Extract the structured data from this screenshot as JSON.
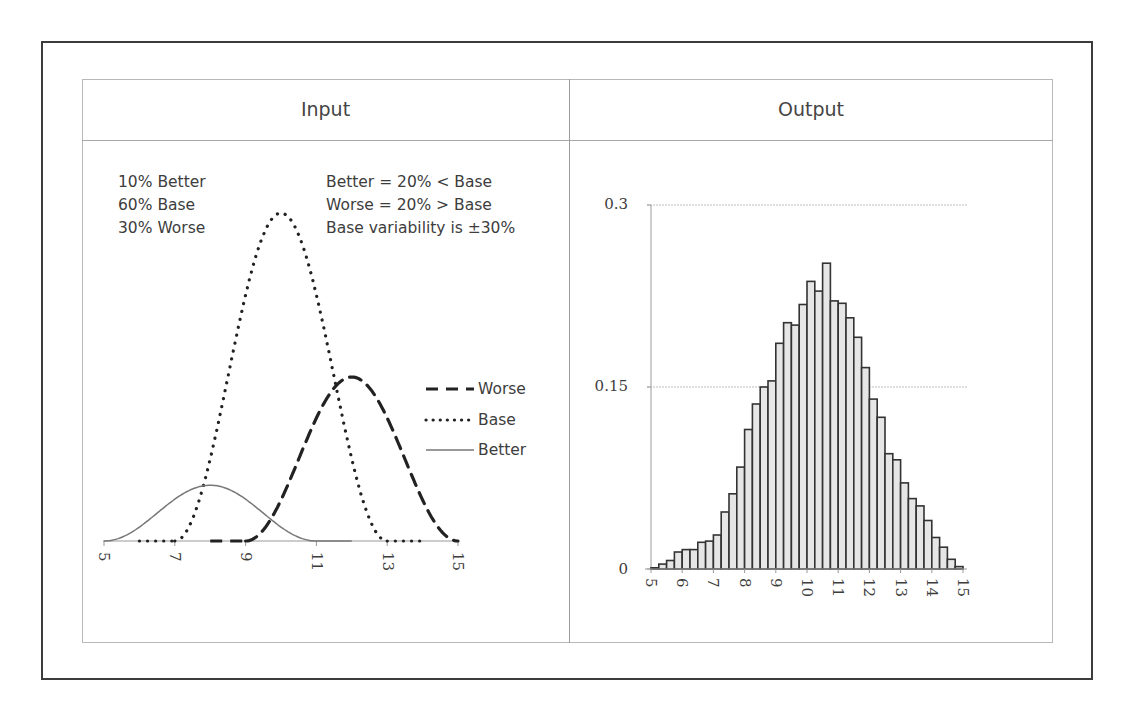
{
  "headers": {
    "input": "Input",
    "output": "Output"
  },
  "input_panel": {
    "mix_notes": [
      "10% Better",
      "60% Base",
      "30% Worse"
    ],
    "rule_notes": [
      "Better = 20% < Base",
      "Worse = 20% > Base",
      "Base variability is ±30%"
    ],
    "legend": [
      {
        "label": "Worse",
        "style": "dashed"
      },
      {
        "label": "Base",
        "style": "dotted"
      },
      {
        "label": "Better",
        "style": "solid"
      }
    ],
    "x_ticks": [
      "5",
      "7",
      "9",
      "11",
      "13",
      "15"
    ]
  },
  "output_panel": {
    "y_ticks": [
      "0.3",
      "0.15",
      "0"
    ],
    "x_ticks": [
      "5",
      "6",
      "7",
      "8",
      "9",
      "10",
      "11",
      "12",
      "13",
      "14",
      "15"
    ]
  },
  "colors": {
    "bar_fill": "#e6e6e6",
    "bar_stroke": "#333333",
    "curve": "#222222",
    "better_curve": "#777777",
    "grid": "#bdbdbd"
  },
  "chart_data": [
    {
      "type": "line",
      "title": "Input",
      "xlabel": "",
      "ylabel": "",
      "xlim": [
        5,
        15
      ],
      "x_ticks": [
        5,
        7,
        9,
        11,
        13,
        15
      ],
      "grid": false,
      "legend_position": "right",
      "annotations": [
        "10% Better",
        "60% Base",
        "30% Worse",
        "Better = 20% < Base",
        "Worse = 20% > Base",
        "Base variability is ±30%"
      ],
      "series": [
        {
          "name": "Worse",
          "style": "dashed",
          "range": [
            9,
            15
          ],
          "peak_x": 12,
          "relative_peak": 0.5
        },
        {
          "name": "Base",
          "style": "dotted",
          "range": [
            7,
            13
          ],
          "peak_x": 10,
          "relative_peak": 1.0
        },
        {
          "name": "Better",
          "style": "solid",
          "range": [
            5,
            11
          ],
          "peak_x": 8,
          "relative_peak": 0.17
        }
      ]
    },
    {
      "type": "bar",
      "title": "Output",
      "xlabel": "",
      "ylabel": "",
      "ylim": [
        0,
        0.3
      ],
      "y_ticks": [
        0,
        0.15,
        0.3
      ],
      "xlim": [
        5,
        15
      ],
      "x_ticks": [
        5,
        6,
        7,
        8,
        9,
        10,
        11,
        12,
        13,
        14,
        15
      ],
      "grid": true,
      "bin_width": 0.25,
      "bin_starts": [
        5.0,
        5.25,
        5.5,
        5.75,
        6.0,
        6.25,
        6.5,
        6.75,
        7.0,
        7.25,
        7.5,
        7.75,
        8.0,
        8.25,
        8.5,
        8.75,
        9.0,
        9.25,
        9.5,
        9.75,
        10.0,
        10.25,
        10.5,
        10.75,
        11.0,
        11.25,
        11.5,
        11.75,
        12.0,
        12.25,
        12.5,
        12.75,
        13.0,
        13.25,
        13.5,
        13.75,
        14.0,
        14.25,
        14.5,
        14.75
      ],
      "values": [
        0.001,
        0.004,
        0.007,
        0.014,
        0.016,
        0.016,
        0.022,
        0.023,
        0.028,
        0.047,
        0.062,
        0.084,
        0.115,
        0.136,
        0.15,
        0.155,
        0.186,
        0.203,
        0.201,
        0.218,
        0.237,
        0.229,
        0.252,
        0.221,
        0.219,
        0.207,
        0.191,
        0.166,
        0.14,
        0.125,
        0.095,
        0.09,
        0.071,
        0.058,
        0.052,
        0.04,
        0.026,
        0.018,
        0.008,
        0.002
      ]
    }
  ]
}
